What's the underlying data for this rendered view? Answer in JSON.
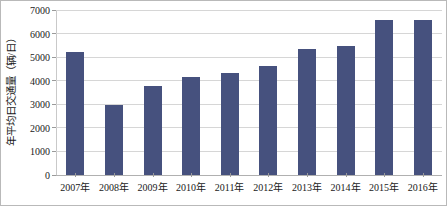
{
  "chart_data": {
    "type": "bar",
    "title": "",
    "xlabel": "",
    "ylabel": "年平均日交通量（辆/日）",
    "categories": [
      "2007年",
      "2008年",
      "2009年",
      "2010年",
      "2011年",
      "2012年",
      "2013年",
      "2014年",
      "2015年",
      "2016年"
    ],
    "values": [
      5200,
      2950,
      3760,
      4170,
      4340,
      4620,
      5330,
      5470,
      6580,
      6560
    ],
    "series": [
      {
        "name": "年平均日交通量",
        "values": [
          5200,
          2950,
          3760,
          4170,
          4340,
          4620,
          5330,
          5470,
          6580,
          6560
        ]
      }
    ],
    "ylim": [
      0,
      7000
    ],
    "ytick_labels": [
      "0",
      "1000",
      "2000",
      "3000",
      "4000",
      "5000",
      "6000",
      "7000"
    ],
    "ytick_values": [
      0,
      1000,
      2000,
      3000,
      4000,
      5000,
      6000,
      7000
    ],
    "grid": true,
    "legend": false,
    "legend_position": "none",
    "bar_color": "#46517e",
    "gridline_color": "#d6d6d6",
    "axis_color": "#b0b0b0",
    "text_color": "#1a1a1a",
    "border_color": "#b9b9b9"
  }
}
